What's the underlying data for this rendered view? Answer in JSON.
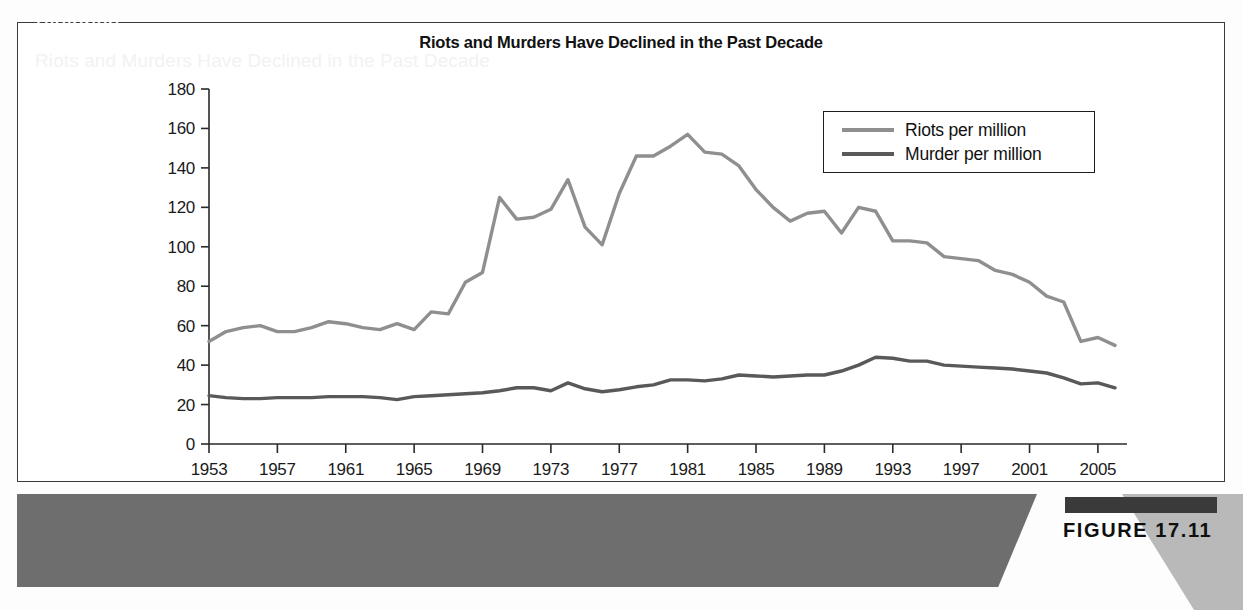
{
  "chart_data": {
    "type": "line",
    "title": "Riots and Murders Have Declined in the Past Decade",
    "xlabel": "",
    "ylabel": "",
    "ylim": [
      0,
      180
    ],
    "ytick_step": 20,
    "yticks": [
      0,
      20,
      40,
      60,
      80,
      100,
      120,
      140,
      160,
      180
    ],
    "xlim": [
      1953,
      2006
    ],
    "xticks": [
      1953,
      1957,
      1961,
      1965,
      1969,
      1973,
      1977,
      1981,
      1985,
      1989,
      1993,
      1997,
      2001,
      2005
    ],
    "xticklabels": [
      "1953",
      "1957",
      "1961",
      "1965",
      "1969",
      "1973",
      "1977",
      "1981",
      "1985",
      "1989",
      "1993",
      "1997",
      "2001",
      "2005"
    ],
    "grid": false,
    "legend_position": "upper right",
    "x": [
      1953,
      1954,
      1955,
      1956,
      1957,
      1958,
      1959,
      1960,
      1961,
      1962,
      1963,
      1964,
      1965,
      1966,
      1967,
      1968,
      1969,
      1970,
      1971,
      1972,
      1973,
      1974,
      1975,
      1976,
      1977,
      1978,
      1979,
      1980,
      1981,
      1982,
      1983,
      1984,
      1985,
      1986,
      1987,
      1988,
      1989,
      1990,
      1991,
      1992,
      1993,
      1994,
      1995,
      1996,
      1997,
      1998,
      1999,
      2000,
      2001,
      2002,
      2003,
      2004,
      2005,
      2006
    ],
    "series": [
      {
        "name": "Riots per million",
        "color": "#8f8f8f",
        "values": [
          52,
          57,
          59,
          60,
          57,
          57,
          59,
          62,
          61,
          59,
          58,
          61,
          58,
          67,
          66,
          82,
          87,
          125,
          114,
          115,
          119,
          134,
          110,
          101,
          127,
          146,
          146,
          151,
          157,
          148,
          147,
          141,
          129,
          120,
          113,
          117,
          118,
          107,
          120,
          118,
          103,
          103,
          102,
          95,
          94,
          93,
          88,
          86,
          82,
          75,
          72,
          52,
          54,
          50
        ]
      },
      {
        "name": "Murder per million",
        "color": "#595959",
        "values": [
          24.5,
          23.5,
          23,
          23,
          23.5,
          23.5,
          23.5,
          24,
          24,
          24,
          23.5,
          22.5,
          24,
          24.5,
          25,
          25.5,
          26,
          27,
          28.5,
          28.5,
          27,
          31,
          28,
          26.5,
          27.5,
          29,
          30,
          32.5,
          32.5,
          32,
          33,
          35,
          34.5,
          34,
          34.5,
          35,
          35,
          37,
          40,
          44,
          43.5,
          42,
          42,
          40,
          39.5,
          39,
          38.5,
          38,
          37,
          36,
          33.5,
          30.5,
          31,
          28.5
        ]
      }
    ]
  },
  "legend": {
    "items": [
      {
        "label": "Riots per million",
        "color": "#8f8f8f"
      },
      {
        "label": "Murder per million",
        "color": "#595959"
      }
    ]
  },
  "caption": {
    "title": "Violence",
    "subtitle": "Riots and Murders Have Declined in the Past Decade"
  },
  "figure": {
    "number": "FIGURE 17.11"
  },
  "colors": {
    "riots": "#8f8f8f",
    "murder": "#595959",
    "caption_band": "#6e6e6e",
    "wedge": "#b9b9b9",
    "badge": "#3a3a3a",
    "frame": "#3b3b3b"
  }
}
